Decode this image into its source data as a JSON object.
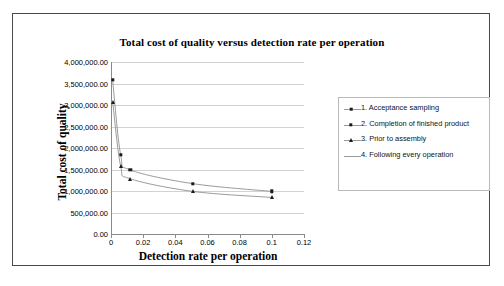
{
  "figure": {
    "caption": "",
    "title": "Total cost of quality versus detection rate per operation"
  },
  "axes": {
    "y_title": "Total cost of quality",
    "x_title": "Detection rate per operation",
    "y_ticks": [
      "0.00",
      "500,000.00",
      "1,000,000.00",
      "1,500,000.00",
      "2,000,000.00",
      "2,500,000.00",
      "3,000,000.00",
      "3,500,000.00",
      "4,000,000.00"
    ],
    "x_ticks": [
      "0",
      "0.02",
      "0.04",
      "0.06",
      "0.08",
      "0.1",
      "0.12"
    ]
  },
  "legend": {
    "items": [
      {
        "label": "1. Acceptance sampling",
        "marker": "diamond"
      },
      {
        "label": "2. Completion of finished product",
        "marker": "square"
      },
      {
        "label": "3. Prior to assembly",
        "marker": "triangle"
      },
      {
        "label": "4. Following every operation",
        "marker": "line"
      }
    ]
  },
  "chart_data": {
    "type": "line",
    "title": "Total cost of quality versus detection rate per operation",
    "xlabel": "Detection rate per operation",
    "ylabel": "Total cost of quality",
    "xlim": [
      0,
      0.12
    ],
    "ylim": [
      0,
      4000000
    ],
    "xticks": [
      0,
      0.02,
      0.04,
      0.06,
      0.08,
      0.1,
      0.12
    ],
    "yticks": [
      0,
      500000,
      1000000,
      1500000,
      2000000,
      2500000,
      3000000,
      3500000,
      4000000
    ],
    "grid": "horizontal",
    "legend_position": "right",
    "series": [
      {
        "name": "1. Acceptance sampling",
        "marker": "diamond",
        "color": "#1a1a1a",
        "points": []
      },
      {
        "name": "2. Completion of finished product",
        "marker": "square",
        "color": "#1a1a1a",
        "points": [
          {
            "x": 0.001,
            "y": 3580000
          },
          {
            "x": 0.006,
            "y": 1840000
          },
          {
            "x": 0.012,
            "y": 1490000
          },
          {
            "x": 0.051,
            "y": 1170000
          },
          {
            "x": 0.1,
            "y": 990000
          }
        ]
      },
      {
        "name": "3. Prior to assembly",
        "marker": "triangle",
        "color": "#1a1a1a",
        "points": [
          {
            "x": 0.001,
            "y": 3080000
          },
          {
            "x": 0.006,
            "y": 1580000
          },
          {
            "x": 0.012,
            "y": 1285000
          },
          {
            "x": 0.051,
            "y": 990000
          },
          {
            "x": 0.1,
            "y": 850000
          }
        ]
      },
      {
        "name": "4. Following every operation",
        "marker": "line",
        "color": "#9a9a9a",
        "points": []
      }
    ]
  }
}
